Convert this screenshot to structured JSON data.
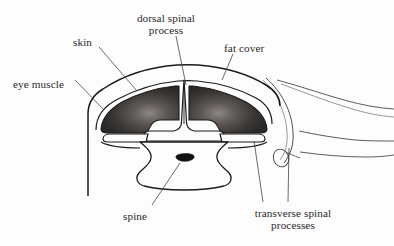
{
  "figure": {
    "type": "anatomical-cross-section-diagram",
    "background_color": "#fdfdfd",
    "line_color": "#1a1a1a",
    "text_color": "#2a2a2a",
    "muscle_fill_dark": "#33302f",
    "muscle_fill_light": "#8d8885"
  },
  "labels": {
    "eye_muscle": {
      "text": "eye muscle",
      "x": 13,
      "y": 78
    },
    "skin": {
      "text": "skin",
      "x": 73,
      "y": 36
    },
    "dorsal_spinal_process": {
      "line1": "dorsal spinal",
      "line2": "process",
      "x": 120,
      "y": 12
    },
    "fat_cover": {
      "text": "fat cover",
      "x": 224,
      "y": 42
    },
    "spine": {
      "text": "spine",
      "x": 123,
      "y": 210
    },
    "transverse_spinal_processes": {
      "line1": "transverse spinal",
      "line2": "processes",
      "x": 238,
      "y": 207
    }
  },
  "parts": [
    {
      "name": "skin",
      "kind": "outline"
    },
    {
      "name": "fat cover",
      "kind": "outline"
    },
    {
      "name": "eye muscle",
      "kind": "shaded-mass"
    },
    {
      "name": "dorsal spinal process",
      "kind": "bone-spike"
    },
    {
      "name": "transverse spinal processes",
      "kind": "bone-outline"
    },
    {
      "name": "spine",
      "kind": "vertebra"
    }
  ]
}
